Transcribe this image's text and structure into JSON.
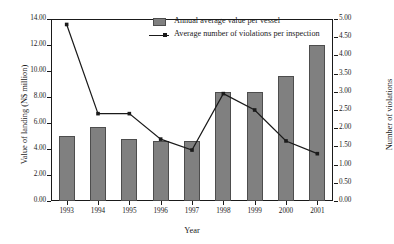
{
  "chart_data": {
    "type": "bar",
    "title": "",
    "xlabel": "Year",
    "ylabel": "Value of landing (N$ million)",
    "y2label": "Number of violations",
    "categories": [
      "1993",
      "1994",
      "1995",
      "1996",
      "1997",
      "1998",
      "1999",
      "2000",
      "2001"
    ],
    "ylim": [
      0.0,
      14.0
    ],
    "y2lim": [
      0.0,
      5.0
    ],
    "yticks": [
      "0.00",
      "2.00",
      "4.00",
      "6.00",
      "8.00",
      "10.00",
      "12.00",
      "14.00"
    ],
    "y2ticks": [
      "0.00",
      "0.50",
      "1.00",
      "1.50",
      "2.00",
      "2.50",
      "3.00",
      "3.50",
      "4.00",
      "4.50",
      "5.00"
    ],
    "grid": false,
    "legend_position": "top-center",
    "series": [
      {
        "name": "Annual average value per vessel",
        "type": "bar",
        "axis": "left",
        "color": "#808080",
        "values": [
          5.0,
          5.7,
          4.8,
          4.6,
          4.6,
          8.35,
          8.4,
          9.6,
          12.0
        ]
      },
      {
        "name": "Average number of violations per inspection",
        "type": "line",
        "axis": "right",
        "color": "#1a1a1a",
        "values": [
          4.85,
          2.4,
          2.4,
          1.7,
          1.4,
          2.95,
          2.5,
          1.65,
          1.3
        ]
      }
    ]
  },
  "legend": {
    "items": [
      {
        "label": "Annual average value per vessel",
        "marker": "bar-swatch"
      },
      {
        "label": "Average number of violations per inspection",
        "marker": "line-swatch"
      }
    ]
  },
  "colors": {
    "bar_fill": "#808080",
    "bar_stroke": "#4d4d4d",
    "line": "#1a1a1a",
    "axis": "#1a1a1a",
    "background": "#ffffff"
  }
}
